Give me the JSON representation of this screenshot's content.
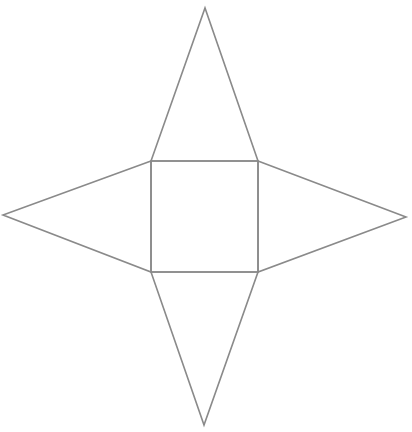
{
  "diagram": {
    "type": "square-pyramid-net",
    "stroke_color": "#8a8a8a",
    "stroke_width": 1.6,
    "background": "#ffffff",
    "square": {
      "points": [
        [
          151,
          161
        ],
        [
          258,
          161
        ],
        [
          258,
          272
        ],
        [
          151,
          272
        ]
      ]
    },
    "triangles": [
      {
        "name": "top",
        "points": [
          [
            151,
            161
          ],
          [
            205,
            8
          ],
          [
            258,
            161
          ]
        ]
      },
      {
        "name": "right",
        "points": [
          [
            258,
            161
          ],
          [
            406,
            217
          ],
          [
            258,
            272
          ]
        ]
      },
      {
        "name": "bottom",
        "points": [
          [
            151,
            272
          ],
          [
            204,
            425
          ],
          [
            258,
            272
          ]
        ]
      },
      {
        "name": "left",
        "points": [
          [
            151,
            161
          ],
          [
            3,
            215
          ],
          [
            151,
            272
          ]
        ]
      }
    ]
  }
}
